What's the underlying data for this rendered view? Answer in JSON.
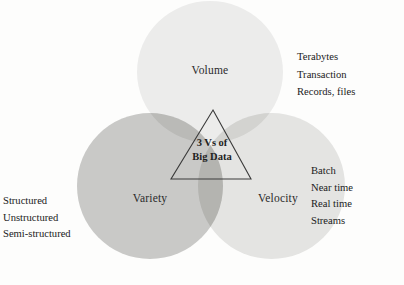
{
  "diagram": {
    "type": "venn",
    "title": "3 Vs of Big Data",
    "background_color": "#fdfdfc",
    "text_color": "#212121",
    "center": {
      "shape": "triangle",
      "line_1": "3 Vs of",
      "line_2": "Big Data",
      "stroke_color": "#3a3a3a"
    },
    "sets": [
      {
        "key": "volume",
        "label": "Volume",
        "fill_color": "#ececeb",
        "position": "top",
        "attributes": [
          "Terabytes",
          "Transaction",
          "Records, files"
        ]
      },
      {
        "key": "variety",
        "label": "Variety",
        "fill_color": "#c9c9c7",
        "position": "bottom-left",
        "attributes": [
          "Structured",
          "Unstructured",
          "Semi-structured"
        ]
      },
      {
        "key": "velocity",
        "label": "Velocity",
        "fill_color": "#e4e4e2",
        "position": "bottom-right",
        "attributes": [
          "Batch",
          "Near time",
          "Real time",
          "Streams"
        ]
      }
    ]
  }
}
